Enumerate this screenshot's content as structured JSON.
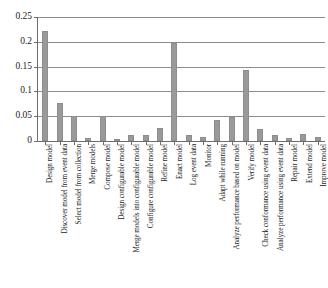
{
  "chart_data": {
    "type": "bar",
    "title": "",
    "subtitle": "",
    "xlabel": "",
    "ylabel": "",
    "ylim": [
      0,
      0.25
    ],
    "yticks": [
      0,
      0.05,
      0.1,
      0.15,
      0.2,
      0.25
    ],
    "ytick_labels": [
      "0",
      "0.05",
      "0.1",
      "0.15",
      "0.2",
      "0.25"
    ],
    "grid": true,
    "legend": false,
    "legend_position": "none",
    "orientation": "vertical",
    "bar_color": "#9a9a9a",
    "categories": [
      "Design model",
      "Discover model from event data",
      "Select model from collection",
      "Merge models",
      "Compose model",
      "Design configurable model",
      "Merge models into configurable model",
      "Configure configurable model",
      "Refine model",
      "Enact model",
      "Log event data",
      "Monitor",
      "Adapt while running",
      "Analyze performance based on model",
      "Verify model",
      "Check conformance using event data",
      "Analyze performance using event data",
      "Repair model",
      "Extend model",
      "Improve model"
    ],
    "values": [
      0.221,
      0.077,
      0.05,
      0.006,
      0.05,
      0.005,
      0.012,
      0.012,
      0.027,
      0.197,
      0.013,
      0.008,
      0.042,
      0.049,
      0.143,
      0.025,
      0.013,
      0.006,
      0.014,
      0.009
    ]
  }
}
